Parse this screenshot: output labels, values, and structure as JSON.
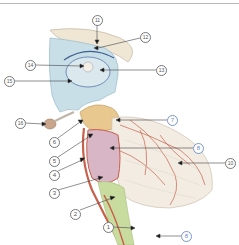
{
  "header": {
    "text": "· · ·  ·   ·  ·  · ·  ·"
  },
  "diagram": {
    "labels": [
      {
        "id": "1",
        "text": "1",
        "x": 108,
        "y": 227,
        "color": "gray"
      },
      {
        "id": "2",
        "text": "2",
        "x": 75,
        "y": 214,
        "color": "gray"
      },
      {
        "id": "3",
        "text": "3",
        "x": 54,
        "y": 193,
        "color": "gray"
      },
      {
        "id": "4",
        "text": "4",
        "x": 54,
        "y": 175,
        "color": "gray"
      },
      {
        "id": "5",
        "text": "5",
        "x": 54,
        "y": 161,
        "color": "gray"
      },
      {
        "id": "6",
        "text": "6",
        "x": 54,
        "y": 142,
        "color": "gray"
      },
      {
        "id": "7",
        "text": "7",
        "x": 172,
        "y": 120,
        "color": "blue"
      },
      {
        "id": "8a",
        "text": "8",
        "x": 198,
        "y": 148,
        "color": "blue"
      },
      {
        "id": "8b",
        "text": "8",
        "x": 186,
        "y": 236,
        "color": "blue"
      },
      {
        "id": "10",
        "text": "10",
        "x": 230,
        "y": 163,
        "color": "gray"
      },
      {
        "id": "11",
        "text": "11",
        "x": 97,
        "y": 20,
        "color": "gray"
      },
      {
        "id": "12",
        "text": "12",
        "x": 145,
        "y": 37,
        "color": "gray"
      },
      {
        "id": "13",
        "text": "13",
        "x": 161,
        "y": 70,
        "color": "gray"
      },
      {
        "id": "14",
        "text": "14",
        "x": 30,
        "y": 65,
        "color": "gray"
      },
      {
        "id": "15",
        "text": "15",
        "x": 9,
        "y": 81,
        "color": "gray"
      },
      {
        "id": "16",
        "text": "16",
        "x": 20,
        "y": 123,
        "color": "gray"
      }
    ],
    "colors": {
      "ventricle": "#c9dfe8",
      "bone": "#efe6d4",
      "midbrain": "#e9c890",
      "pons": "#d8b6c6",
      "medulla": "#c9dca0",
      "vessel": "#c8604a",
      "cerebellum": "#f2ece2",
      "label_gray": "#777777",
      "label_blue": "#6a86c0"
    }
  }
}
